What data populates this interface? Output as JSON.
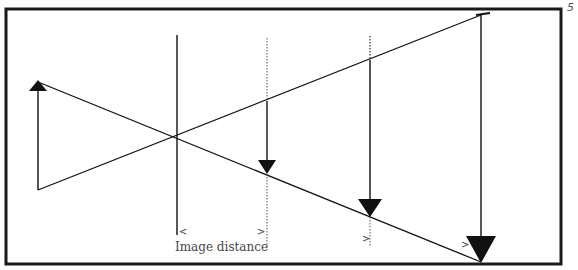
{
  "figure": {
    "number": "5",
    "caption_label": "Image distance",
    "colors": {
      "ink": "#111111",
      "frame": "#1a1a1a",
      "label": "#444444",
      "background": "#ffffff"
    }
  },
  "markers": {
    "left": "<",
    "right": ">"
  },
  "diagram": {
    "type": "ray diagram (converging lens, multiple image positions)",
    "frame": {
      "x1": 6,
      "y1": 9,
      "x2": 561,
      "y2": 264
    },
    "lens": {
      "x": 177,
      "y_top": 35,
      "y_bottom": 235
    },
    "object_arrow": {
      "x": 38,
      "y_base": 190,
      "y_tip": 82,
      "direction": "up"
    },
    "rays": [
      {
        "from": [
          38,
          82
        ],
        "to": [
          481,
          262
        ]
      },
      {
        "from": [
          38,
          190
        ],
        "to": [
          481,
          15
        ]
      }
    ],
    "image_arrows": [
      {
        "x": 267,
        "y_top": 101,
        "y_tip": 172,
        "size": "small",
        "dotted_ext_top": 38,
        "dotted_ext_bottom": 226
      },
      {
        "x": 370,
        "y_top": 60,
        "y_tip": 216,
        "size": "medium",
        "dotted_ext_top": 38,
        "dotted_ext_bottom": 246
      },
      {
        "x": 481,
        "y_top": 15,
        "y_tip": 262,
        "size": "large"
      }
    ]
  }
}
